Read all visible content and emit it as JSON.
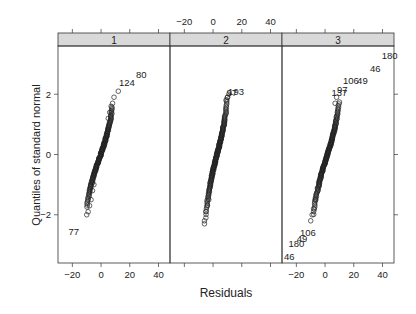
{
  "chart_data": {
    "type": "scatter",
    "subtype": "normal QQ plot (lattice, 3 panels)",
    "title": "",
    "xlabel": "Residuals",
    "ylabel": "Quantiles of standard normal",
    "xlim": [
      -30,
      48
    ],
    "ylim": [
      -3.6,
      3.6
    ],
    "x_ticks": [
      -20,
      0,
      20,
      40
    ],
    "y_ticks": [
      -2,
      0,
      2
    ],
    "x_tick_labels": [
      "-20",
      "0",
      "20",
      "40"
    ],
    "y_tick_labels": [
      "-2",
      "0",
      "2"
    ],
    "grid": false,
    "legend": null,
    "panels": [
      {
        "strip_label": "1",
        "bulk": {
          "x_range": [
            -10,
            8
          ],
          "y_range": [
            -1.8,
            1.6
          ]
        },
        "points": [
          {
            "x": -10,
            "y": -2.0
          },
          {
            "x": -9,
            "y": -1.9
          },
          {
            "x": -8,
            "y": -1.7
          },
          {
            "x": -7,
            "y": -1.5
          },
          {
            "x": -6,
            "y": -1.2
          },
          {
            "x": -5,
            "y": -1.0
          },
          {
            "x": 5,
            "y": 1.2
          },
          {
            "x": 6,
            "y": 1.4
          },
          {
            "x": 7,
            "y": 1.6
          },
          {
            "x": 8,
            "y": 1.7
          },
          {
            "x": 9,
            "y": 1.9
          },
          {
            "x": 12,
            "y": 2.1
          }
        ],
        "labeled_points": [
          {
            "label": "77",
            "x": -19,
            "y": -2.55
          },
          {
            "label": "124",
            "x": 18,
            "y": 2.4
          },
          {
            "label": "80",
            "x": 28,
            "y": 2.65
          }
        ]
      },
      {
        "strip_label": "2",
        "bulk": {
          "x_range": [
            -5,
            10
          ],
          "y_range": [
            -2.0,
            1.9
          ]
        },
        "points": [
          {
            "x": -6,
            "y": -2.3
          },
          {
            "x": -6,
            "y": -2.2
          },
          {
            "x": -5,
            "y": -2.1
          },
          {
            "x": -5,
            "y": -1.9
          },
          {
            "x": -4,
            "y": -1.7
          },
          {
            "x": -3,
            "y": -1.5
          },
          {
            "x": 9,
            "y": 1.8
          },
          {
            "x": 10,
            "y": 1.9
          },
          {
            "x": 11,
            "y": 2.0
          }
        ],
        "labeled_points": [
          {
            "label": "193",
            "x": 16,
            "y": 2.1
          },
          {
            "label": "97",
            "x": 13,
            "y": 2.05
          }
        ]
      },
      {
        "strip_label": "3",
        "bulk": {
          "x_range": [
            -8,
            10
          ],
          "y_range": [
            -2.0,
            1.8
          ]
        },
        "points": [
          {
            "x": -10,
            "y": -2.2
          },
          {
            "x": -9,
            "y": -2.0
          },
          {
            "x": -8,
            "y": -1.8
          },
          {
            "x": -7,
            "y": -1.5
          },
          {
            "x": 7,
            "y": 1.7
          },
          {
            "x": 8,
            "y": 1.9
          }
        ],
        "labeled_points": [
          {
            "label": "46",
            "x": -25,
            "y": -3.4
          },
          {
            "label": "180",
            "x": -20,
            "y": -2.95
          },
          {
            "label": "49",
            "x": -16,
            "y": -2.8
          },
          {
            "label": "106",
            "x": -12,
            "y": -2.6
          },
          {
            "label": "137",
            "x": 10,
            "y": 2.05
          },
          {
            "label": "97",
            "x": 12,
            "y": 2.15
          },
          {
            "label": "106",
            "x": 18,
            "y": 2.45
          },
          {
            "label": "49",
            "x": 26,
            "y": 2.45
          },
          {
            "label": "46",
            "x": 35,
            "y": 2.85
          },
          {
            "label": "180",
            "x": 45,
            "y": 3.3
          }
        ]
      }
    ],
    "top_axis_panel_index": 1,
    "bottom_axis_panel_indices": [
      0,
      2
    ]
  },
  "colors": {
    "strip_bg": "#d9d9d9",
    "frame": "#333333",
    "point": "#222222",
    "text": "#222222"
  }
}
